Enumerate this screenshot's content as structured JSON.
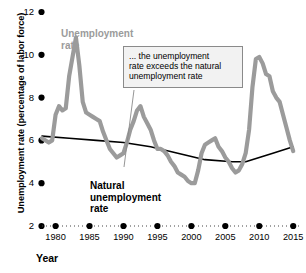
{
  "chart_data": {
    "type": "line",
    "title": "",
    "xlabel": "Year",
    "ylabel": "Unemployment rate (percentage of labor force)",
    "xlim": [
      1978,
      2016
    ],
    "ylim": [
      2,
      12
    ],
    "grid": false,
    "legend_position": "inline-labels",
    "xticks": [
      "1980",
      "1985",
      "1990",
      "1995",
      "2000",
      "2005",
      "2010",
      "2015"
    ],
    "xtick_values": [
      1980,
      1985,
      1990,
      1995,
      2000,
      2005,
      2010,
      2015
    ],
    "yticks": [
      "2",
      "4",
      "6",
      "8",
      "10",
      "12"
    ],
    "ytick_values": [
      2,
      4,
      6,
      8,
      10,
      12
    ],
    "annotations": [
      {
        "name": "gap-callout",
        "text": "... the unemployment\nrate exceeds the natural\nunemployment rate"
      }
    ],
    "series": [
      {
        "name": "Unemployment rate",
        "label": "Unemployment\nrate",
        "color": "#9b9b9b",
        "x": [
          1978,
          1979,
          1979.5,
          1980,
          1980.5,
          1981,
          1981.5,
          1982,
          1982.5,
          1983,
          1983.5,
          1984,
          1984.5,
          1985,
          1985.5,
          1986,
          1986.5,
          1987,
          1987.5,
          1988,
          1988.5,
          1989,
          1989.5,
          1990,
          1990.5,
          1991,
          1991.5,
          1992,
          1992.5,
          1993,
          1993.5,
          1994,
          1994.5,
          1995,
          1995.5,
          1996,
          1996.5,
          1997,
          1997.5,
          1998,
          1998.5,
          1999,
          1999.5,
          2000,
          2000.5,
          2001,
          2001.5,
          2002,
          2002.5,
          2003,
          2003.5,
          2004,
          2004.5,
          2005,
          2005.5,
          2006,
          2006.5,
          2007,
          2007.5,
          2008,
          2008.5,
          2009,
          2009.5,
          2010,
          2010.5,
          2011,
          2011.5,
          2012,
          2012.5,
          2013,
          2013.5,
          2014,
          2014.5,
          2015
        ],
        "values": [
          6.1,
          5.9,
          6.0,
          7.2,
          7.6,
          7.4,
          7.5,
          9.0,
          9.9,
          10.8,
          9.5,
          7.8,
          7.3,
          7.2,
          7.1,
          7.0,
          6.9,
          6.4,
          6.0,
          5.6,
          5.4,
          5.2,
          5.3,
          5.4,
          5.9,
          6.5,
          6.9,
          7.4,
          7.6,
          7.1,
          6.8,
          6.5,
          6.0,
          5.6,
          5.6,
          5.5,
          5.3,
          5.0,
          4.8,
          4.5,
          4.4,
          4.3,
          4.1,
          4.0,
          4.0,
          4.6,
          5.4,
          5.8,
          5.9,
          6.0,
          6.1,
          5.7,
          5.5,
          5.2,
          5.0,
          4.7,
          4.5,
          4.6,
          4.9,
          5.4,
          6.5,
          8.5,
          9.8,
          9.9,
          9.6,
          9.1,
          9.0,
          8.3,
          8.0,
          7.8,
          7.2,
          6.6,
          6.0,
          5.5
        ]
      },
      {
        "name": "Natural unemployment rate",
        "label": "Natural\nunemployment\nrate",
        "color": "#000000",
        "x": [
          1978,
          1982,
          1986,
          1990,
          1994,
          1998,
          2002,
          2006,
          2008,
          2010,
          2012,
          2015
        ],
        "values": [
          6.2,
          6.1,
          6.0,
          5.9,
          5.7,
          5.4,
          5.1,
          5.0,
          5.0,
          5.2,
          5.4,
          5.7
        ]
      }
    ]
  },
  "axes": {
    "y_title": "Unemployment rate (percentage of labor force)",
    "x_title": "Year"
  }
}
